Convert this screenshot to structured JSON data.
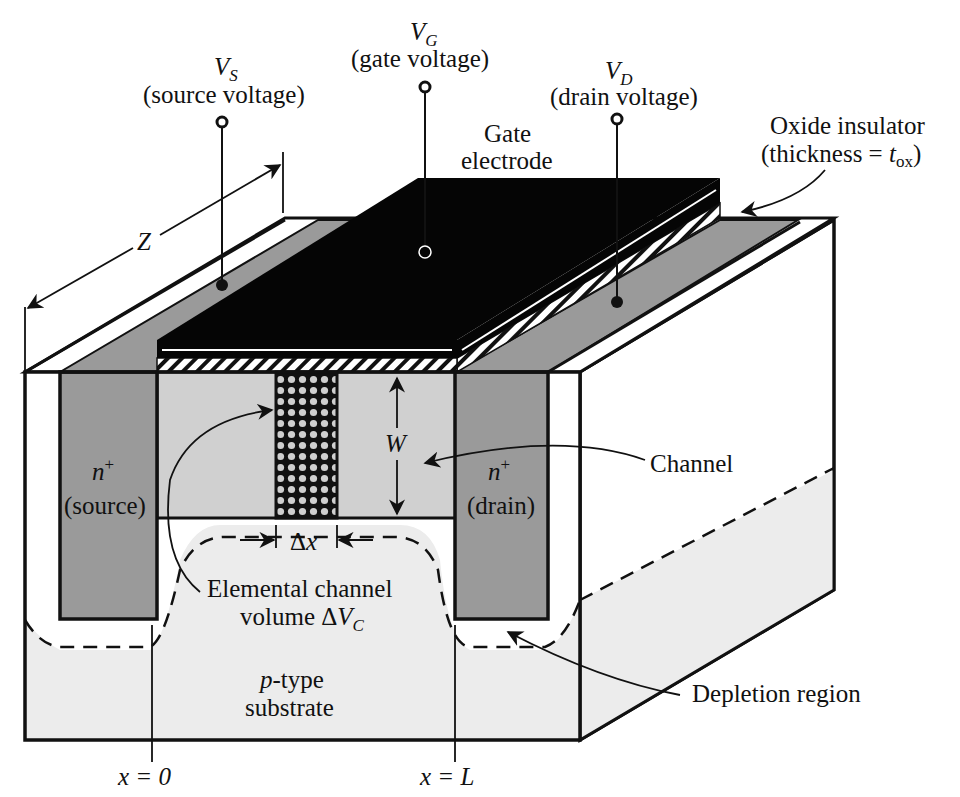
{
  "figure": {
    "colors": {
      "background": "#ffffff",
      "gate_electrode": "#050505",
      "n_plus_region": "#9a9a9a",
      "channel": "#d0d0d0",
      "substrate": "#ececec",
      "outline": "#111111"
    }
  },
  "terminals": {
    "source": {
      "symbol": "V",
      "subscript": "S",
      "desc": "(source voltage)"
    },
    "gate": {
      "symbol": "V",
      "subscript": "G",
      "desc": "(gate voltage)"
    },
    "drain": {
      "symbol": "V",
      "subscript": "D",
      "desc": "(drain voltage)"
    }
  },
  "labels": {
    "gate_electrode_line1": "Gate",
    "gate_electrode_line2": "electrode",
    "oxide_line1": "Oxide insulator",
    "oxide_line2_prefix": "(thickness = ",
    "oxide_symbol": "t",
    "oxide_subscript": "ox",
    "oxide_line2_suffix": ")",
    "z_dim": "Z",
    "w_dim": "W",
    "dx_dim": "Δx",
    "source_region_top": "n",
    "source_region_sup": "+",
    "source_region_bottom": "(source)",
    "drain_region_top": "n",
    "drain_region_sup": "+",
    "drain_region_bottom": "(drain)",
    "channel": "Channel",
    "elemental_line1": "Elemental channel",
    "elemental_line2_prefix": "volume Δ",
    "elemental_symbol": "V",
    "elemental_subscript": "C",
    "substrate_prefix": "p",
    "substrate_line1_suffix": "-type",
    "substrate_line2": "substrate",
    "depletion": "Depletion region",
    "x0": "x = 0",
    "xL": "x = L"
  }
}
